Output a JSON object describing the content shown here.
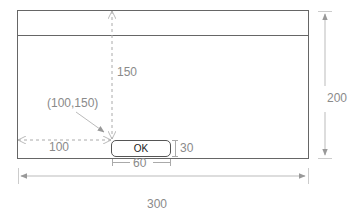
{
  "diagram": {
    "window": {
      "width_label": "300",
      "height_label": "200"
    },
    "button": {
      "label": "OK",
      "width_label": "60",
      "height_label": "30"
    },
    "offsets": {
      "x_label": "100",
      "y_label": "150",
      "origin_label": "(100,150)"
    },
    "colors": {
      "frame": "#666666",
      "dimension": "#aaaaaa",
      "text": "#8a8a8a"
    }
  }
}
